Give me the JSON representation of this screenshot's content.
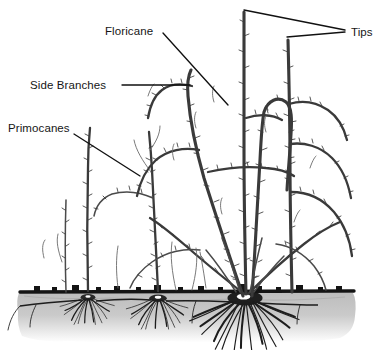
{
  "figure": {
    "background_color": "#ffffff",
    "ink_color": "#3a3a3a",
    "label_color": "#161616",
    "soil_color": "#c9c9c9",
    "soil_line_color": "#141414"
  },
  "labels": [
    {
      "id": "floricane",
      "text": "Floricane",
      "x": 105,
      "y": 35,
      "anchor": "start",
      "leader": "M163,33 L228,105"
    },
    {
      "id": "tips",
      "text": "Tips",
      "x": 351,
      "y": 36,
      "anchor": "start",
      "leader": "M244,10 L345,30 M287,37 L345,32"
    },
    {
      "id": "side-branches",
      "text": "Side Branches",
      "x": 30,
      "y": 89,
      "anchor": "start",
      "leader": "M122,85 L190,85"
    },
    {
      "id": "primocanes",
      "text": "Primocanes",
      "x": 8,
      "y": 132,
      "anchor": "start",
      "leader": "M74,134 L140,176"
    }
  ],
  "soil": {
    "surface_y": 291,
    "left": 18,
    "right": 356,
    "depth": 52,
    "name": "soil-layer"
  },
  "crowns": [
    {
      "id": "crown-left",
      "x": 88,
      "y": 299,
      "scale": 0.82
    },
    {
      "id": "crown-middle",
      "x": 158,
      "y": 300,
      "scale": 0.88
    },
    {
      "id": "crown-main",
      "x": 245,
      "y": 302,
      "scale": 1.35
    }
  ],
  "canes": {
    "count_primocanes": 4,
    "count_floricanes": 3,
    "description": "Thorny upright canes with arching lateral side branches"
  }
}
